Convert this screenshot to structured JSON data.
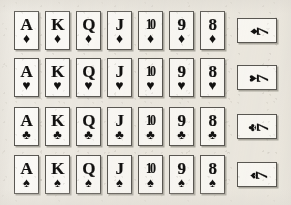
{
  "image": {
    "title": "Playing card rank chart",
    "description": "Four rows of playing cards, one row per suit, showing ranks Ace through Eight upright plus a sideways Seven card at the end of each row.",
    "background_color": "#edeae3",
    "card_face_color": "#fbfaf7",
    "ink_color": "#121110",
    "border_color": "#5a5853"
  },
  "suit_glyphs": {
    "diamond": "♦",
    "heart": "♥",
    "club": "♣",
    "spade": "♠"
  },
  "rows": [
    {
      "suit": "diamond",
      "suit_name": "Diamonds",
      "suit_symbol": "♦",
      "cards": [
        {
          "rank": "A",
          "suit_symbol": "♦"
        },
        {
          "rank": "K",
          "suit_symbol": "♦"
        },
        {
          "rank": "Q",
          "suit_symbol": "♦"
        },
        {
          "rank": "J",
          "suit_symbol": "♦"
        },
        {
          "rank": "10",
          "suit_symbol": "♦"
        },
        {
          "rank": "9",
          "suit_symbol": "♦"
        },
        {
          "rank": "8",
          "suit_symbol": "♦"
        }
      ],
      "sideways_card": {
        "rank": "7",
        "suit_symbol": "♦"
      }
    },
    {
      "suit": "heart",
      "suit_name": "Hearts",
      "suit_symbol": "♥",
      "cards": [
        {
          "rank": "A",
          "suit_symbol": "♥"
        },
        {
          "rank": "K",
          "suit_symbol": "♥"
        },
        {
          "rank": "Q",
          "suit_symbol": "♥"
        },
        {
          "rank": "J",
          "suit_symbol": "♥"
        },
        {
          "rank": "10",
          "suit_symbol": "♥"
        },
        {
          "rank": "9",
          "suit_symbol": "♥"
        },
        {
          "rank": "8",
          "suit_symbol": "♥"
        }
      ],
      "sideways_card": {
        "rank": "7",
        "suit_symbol": "♥"
      }
    },
    {
      "suit": "club",
      "suit_name": "Clubs",
      "suit_symbol": "♣",
      "cards": [
        {
          "rank": "A",
          "suit_symbol": "♣"
        },
        {
          "rank": "K",
          "suit_symbol": "♣"
        },
        {
          "rank": "Q",
          "suit_symbol": "♣"
        },
        {
          "rank": "J",
          "suit_symbol": "♣"
        },
        {
          "rank": "10",
          "suit_symbol": "♣"
        },
        {
          "rank": "9",
          "suit_symbol": "♣"
        },
        {
          "rank": "8",
          "suit_symbol": "♣"
        }
      ],
      "sideways_card": {
        "rank": "7",
        "suit_symbol": "♣"
      }
    },
    {
      "suit": "spade",
      "suit_name": "Spades",
      "suit_symbol": "♠",
      "cards": [
        {
          "rank": "A",
          "suit_symbol": "♠"
        },
        {
          "rank": "K",
          "suit_symbol": "♠"
        },
        {
          "rank": "Q",
          "suit_symbol": "♠"
        },
        {
          "rank": "J",
          "suit_symbol": "♠"
        },
        {
          "rank": "10",
          "suit_symbol": "♠"
        },
        {
          "rank": "9",
          "suit_symbol": "♠"
        },
        {
          "rank": "8",
          "suit_symbol": "♠"
        }
      ],
      "sideways_card": {
        "rank": "7",
        "suit_symbol": "♠"
      }
    }
  ]
}
